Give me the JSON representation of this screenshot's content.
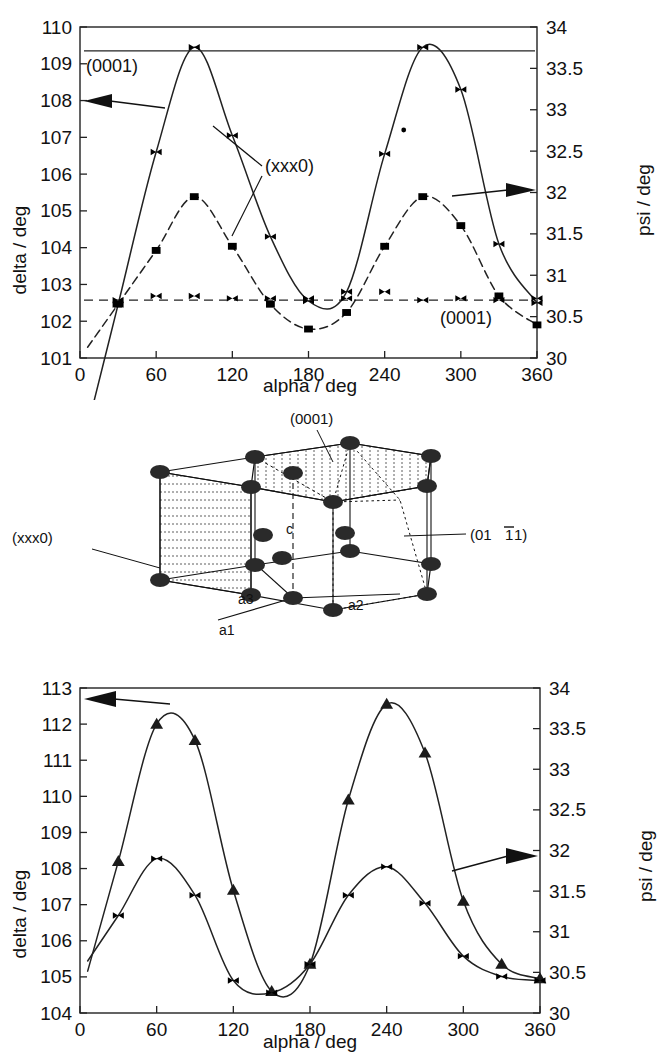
{
  "figure": {
    "title_hidden": "",
    "panels": [
      "top-chart",
      "crystal-diagram",
      "bottom-chart"
    ]
  },
  "top_chart": {
    "left_axis_label": "delta / deg",
    "right_axis_label": "psi / deg",
    "x_axis_label": "alpha / deg",
    "annotations": {
      "upper_left_plane": "(0001)",
      "mid_plane": "(xxx0)",
      "lower_right_plane": "(0001)"
    },
    "left_arrow_icon": "left-triangle-arrow",
    "right_arrow_icon": "right-triangle-arrow"
  },
  "crystal": {
    "label_top": "(0001)",
    "label_left": "(xxx0)",
    "label_right": "(0111)",
    "label_right_overline_index": 1,
    "axis_c": "c",
    "axis_a1": "a1",
    "axis_a2": "a2",
    "axis_a3": "a3"
  },
  "bottom_chart": {
    "left_axis_label": "delta / deg",
    "right_axis_label": "psi / deg",
    "x_axis_label": "alpha / deg",
    "annotations": {
      "plane": "(0111)",
      "plane_overline_index": 1
    },
    "left_arrow_icon": "left-triangle-arrow",
    "right_arrow_icon": "right-triangle-arrow"
  },
  "chart_data": [
    {
      "id": "top",
      "type": "line",
      "title": "",
      "xlabel": "alpha / deg",
      "ylabel": "delta / deg",
      "y2label": "psi / deg",
      "xlim": [
        0,
        360
      ],
      "ylim": [
        101,
        110
      ],
      "y2lim": [
        30,
        34
      ],
      "xticks": [
        0,
        60,
        120,
        180,
        240,
        300,
        360
      ],
      "yticks": [
        101,
        102,
        103,
        104,
        105,
        106,
        107,
        108,
        109,
        110
      ],
      "y2ticks": [
        30,
        30.5,
        31,
        31.5,
        32,
        32.5,
        33,
        33.5,
        34
      ],
      "grid": false,
      "legend": "none",
      "series": [
        {
          "name": "(xxx0) delta",
          "axis": "left",
          "marker": "bowtie",
          "linestyle": "solid",
          "x": [
            30,
            60,
            90,
            120,
            150,
            180,
            210,
            240,
            270,
            300,
            330,
            360
          ],
          "values": [
            102.45,
            106.6,
            109.45,
            107.05,
            104.3,
            102.55,
            102.8,
            106.55,
            109.45,
            108.3,
            104.1,
            102.5
          ]
        },
        {
          "name": "(xxx0) psi",
          "axis": "right",
          "marker": "square",
          "linestyle": "dashed",
          "x": [
            30,
            60,
            90,
            120,
            150,
            180,
            210,
            240,
            270,
            300,
            330,
            360
          ],
          "values": [
            30.65,
            31.3,
            31.95,
            31.35,
            30.65,
            30.35,
            30.55,
            31.35,
            31.95,
            31.6,
            30.75,
            30.4
          ]
        },
        {
          "name": "(0001) delta",
          "axis": "left",
          "marker": "none",
          "linestyle": "solid-flat",
          "x": [
            0,
            360
          ],
          "values": [
            109.35,
            109.35
          ]
        },
        {
          "name": "(0001) psi",
          "axis": "right",
          "marker": "bowtie",
          "linestyle": "dashed-flat",
          "x": [
            30,
            60,
            90,
            120,
            150,
            180,
            210,
            240,
            270,
            300,
            330,
            360
          ],
          "values": [
            30.7,
            30.75,
            30.75,
            30.72,
            30.72,
            30.72,
            30.72,
            30.8,
            30.7,
            30.72,
            30.7,
            30.72
          ]
        },
        {
          "name": "stray point",
          "axis": "left",
          "marker": "dot",
          "linestyle": "none",
          "x": [
            255
          ],
          "values": [
            107.2
          ]
        }
      ]
    },
    {
      "id": "bottom",
      "type": "line",
      "title": "",
      "xlabel": "alpha / deg",
      "ylabel": "delta / deg",
      "y2label": "psi / deg",
      "xlim": [
        0,
        360
      ],
      "ylim": [
        104,
        113
      ],
      "y2lim": [
        30,
        34
      ],
      "xticks": [
        0,
        60,
        120,
        180,
        240,
        300,
        360
      ],
      "yticks": [
        104,
        105,
        106,
        107,
        108,
        109,
        110,
        111,
        112,
        113
      ],
      "y2ticks": [
        30,
        30.5,
        31,
        31.5,
        32,
        32.5,
        33,
        33.5,
        34
      ],
      "grid": false,
      "legend": "none",
      "series": [
        {
          "name": "(0111) delta",
          "axis": "left",
          "marker": "triangle",
          "linestyle": "solid",
          "x": [
            30,
            60,
            90,
            120,
            150,
            180,
            210,
            240,
            270,
            300,
            330,
            360
          ],
          "values": [
            108.2,
            112.0,
            111.55,
            107.4,
            104.6,
            105.35,
            109.9,
            112.55,
            111.2,
            107.1,
            105.35,
            104.95
          ]
        },
        {
          "name": "(0111) psi",
          "axis": "right",
          "marker": "bowtie",
          "linestyle": "solid",
          "x": [
            30,
            60,
            90,
            120,
            150,
            180,
            210,
            240,
            270,
            300,
            330,
            360
          ],
          "values": [
            31.2,
            31.9,
            31.45,
            30.4,
            30.25,
            30.6,
            31.45,
            31.8,
            31.35,
            30.7,
            30.45,
            30.4
          ]
        }
      ]
    }
  ]
}
